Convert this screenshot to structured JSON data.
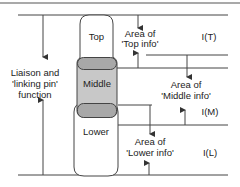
{
  "diagram": {
    "left_label": [
      "Liaison and",
      "'linking pin'",
      "function"
    ],
    "boxes": {
      "top": "Top",
      "middle": "Middle",
      "lower": "Lower"
    },
    "areas": {
      "top": [
        "Area of",
        "'Top info'"
      ],
      "middle": [
        "Area of",
        "'Middle info'"
      ],
      "lower": [
        "Area of",
        "'Lower info'"
      ]
    },
    "levels": {
      "top": "I(T)",
      "middle": "I(M)",
      "lower": "I(L)"
    },
    "colors": {
      "line": "#333333",
      "middle_fill": "#c8c8c8",
      "overlap_fill": "#a8a8a8",
      "text": "#222222"
    }
  }
}
